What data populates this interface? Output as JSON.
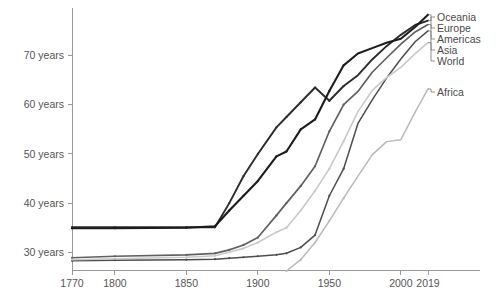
{
  "chart_data": {
    "type": "line",
    "title": "",
    "subtitle": "",
    "xlabel": "",
    "ylabel": "",
    "xlim": [
      1770,
      2019
    ],
    "ylim": [
      26,
      76
    ],
    "grid": false,
    "legend_position": "right-inline-labels",
    "y_tick_labels": [
      "30 years",
      "40 years",
      "50 years",
      "60 years",
      "70 years"
    ],
    "y_ticks": [
      30,
      40,
      50,
      60,
      70
    ],
    "x_ticks": [
      1770,
      1800,
      1850,
      1900,
      1950,
      2000,
      2019
    ],
    "x_tick_labels": [
      "1770",
      "1800",
      "1850",
      "1900",
      "1950",
      "2000",
      "2019"
    ],
    "series": [
      {
        "name": "Oceania",
        "color": "#2b2b2b",
        "width": 1.9,
        "x": [
          1770,
          1800,
          1850,
          1870,
          1880,
          1890,
          1900,
          1913,
          1920,
          1930,
          1940,
          1950,
          1960,
          1970,
          1980,
          1990,
          2000,
          2010,
          2019
        ],
        "y": [
          35.1,
          35.1,
          35.1,
          35.1,
          40.0,
          45.5,
          50.0,
          55.4,
          57.5,
          60.5,
          63.5,
          60.8,
          63.8,
          66.0,
          69.2,
          71.9,
          74.2,
          76.2,
          77.1
        ]
      },
      {
        "name": "Europe",
        "color": "#1c1c1c",
        "width": 2.1,
        "x": [
          1770,
          1800,
          1850,
          1870,
          1880,
          1890,
          1900,
          1913,
          1920,
          1930,
          1940,
          1950,
          1960,
          1970,
          1980,
          1990,
          2000,
          2010,
          2019
        ],
        "y": [
          34.9,
          34.9,
          35.0,
          35.3,
          38.5,
          41.5,
          44.5,
          49.5,
          50.5,
          55.0,
          57.0,
          62.8,
          68.0,
          70.4,
          71.5,
          72.6,
          73.4,
          75.8,
          78.3
        ]
      },
      {
        "name": "Americas",
        "color": "#606060",
        "width": 1.7,
        "x": [
          1770,
          1800,
          1850,
          1870,
          1880,
          1890,
          1900,
          1913,
          1920,
          1930,
          1940,
          1950,
          1960,
          1970,
          1980,
          1990,
          2000,
          2010,
          2019
        ],
        "y": [
          28.9,
          29.2,
          29.5,
          29.8,
          30.5,
          31.5,
          33.0,
          37.5,
          40.0,
          43.5,
          47.5,
          54.6,
          60.0,
          62.7,
          66.6,
          69.5,
          72.3,
          74.8,
          76.3
        ]
      },
      {
        "name": "Asia",
        "color": "#4d4d4d",
        "width": 1.5,
        "x": [
          1770,
          1800,
          1850,
          1870,
          1880,
          1890,
          1900,
          1913,
          1920,
          1930,
          1940,
          1950,
          1960,
          1970,
          1980,
          1990,
          2000,
          2010,
          2019
        ],
        "y": [
          28.3,
          28.4,
          28.5,
          28.6,
          28.8,
          29.0,
          29.2,
          29.5,
          29.8,
          31.0,
          33.5,
          41.5,
          47.0,
          56.2,
          61.0,
          65.4,
          69.3,
          72.8,
          75.0
        ]
      },
      {
        "name": "World",
        "color": "#c9c9c9",
        "width": 1.6,
        "x": [
          1770,
          1800,
          1850,
          1870,
          1880,
          1890,
          1900,
          1913,
          1920,
          1930,
          1940,
          1950,
          1960,
          1970,
          1980,
          1990,
          2000,
          2010,
          2019
        ],
        "y": [
          28.5,
          28.7,
          29.0,
          29.3,
          30.0,
          30.8,
          32.0,
          34.1,
          35.0,
          38.5,
          42.5,
          47.0,
          52.6,
          58.6,
          62.9,
          65.5,
          67.6,
          70.4,
          72.6
        ]
      },
      {
        "name": "Africa",
        "color": "#b9b9b9",
        "width": 1.5,
        "x": [
          1920,
          1930,
          1940,
          1950,
          1960,
          1970,
          1980,
          1990,
          2000,
          2010,
          2019
        ],
        "y": [
          26.2,
          28.5,
          32.0,
          36.4,
          41.0,
          45.5,
          49.8,
          52.5,
          52.9,
          58.5,
          63.2
        ]
      }
    ],
    "legend_entries": [
      {
        "label": "Oceania",
        "color": "#2b2b2b"
      },
      {
        "label": "Europe",
        "color": "#1c1c1c"
      },
      {
        "label": "Americas",
        "color": "#606060"
      },
      {
        "label": "Asia",
        "color": "#4d4d4d"
      },
      {
        "label": "World",
        "color": "#c9c9c9"
      },
      {
        "label": "Africa",
        "color": "#b9b9b9"
      }
    ]
  }
}
